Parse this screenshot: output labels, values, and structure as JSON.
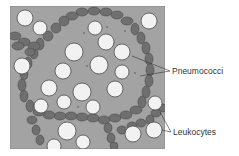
{
  "diagram": {
    "type": "micrograph-illustration",
    "background_color": "#a3a3a3",
    "chain_color": "#6f6f6f",
    "cell_color": "#f2f2f2",
    "labels": {
      "pneumococci": "Pneumococci",
      "leukocytes": "Leukocytes"
    }
  }
}
